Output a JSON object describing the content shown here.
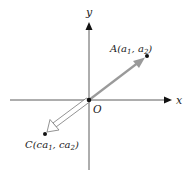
{
  "axes": {
    "x_label": "x",
    "y_label": "y",
    "origin_label": "O"
  },
  "points": {
    "A": {
      "label": "A(a",
      "sub1": "1",
      "mid": ", a",
      "sub2": "2",
      "end": ")"
    },
    "C": {
      "label": "C(ca",
      "sub1": "1",
      "mid": ", ca",
      "sub2": "2",
      "end": ")"
    }
  },
  "colors": {
    "axis": "#333333",
    "vector_a": "#9a9a9a",
    "vector_c_outline": "#777777",
    "point": "#111111"
  }
}
